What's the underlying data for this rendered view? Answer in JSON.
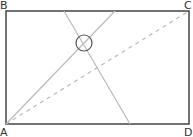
{
  "diagram": {
    "labels": {
      "A": "A",
      "B": "B",
      "C": "C",
      "D": "D"
    },
    "colors": {
      "border": "#444444",
      "line": "#bbbbbb",
      "dashed": "#bbbbbb",
      "circle": "#555555",
      "label": "#333333"
    }
  }
}
